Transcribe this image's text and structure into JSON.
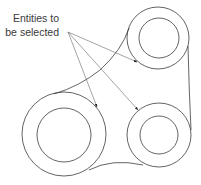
{
  "figure": {
    "annotation": {
      "line1": "Entities to",
      "line2": "be selected"
    },
    "colors": {
      "stroke": "#3c3c3c",
      "arrow": "#555555",
      "text": "#3a3a3a",
      "background": "#ffffff"
    },
    "circles": [
      {
        "name": "top-right",
        "cx": 158,
        "cy": 38,
        "r_outer": 31,
        "r_inner": 20
      },
      {
        "name": "left",
        "cx": 64,
        "cy": 134,
        "r_outer": 42,
        "r_inner": 27
      },
      {
        "name": "bottom-right",
        "cx": 159,
        "cy": 135,
        "r_outer": 32,
        "r_inner": 19
      }
    ],
    "arrows": {
      "origin": [
        68,
        32
      ],
      "targets": [
        [
          137,
          62
        ],
        [
          97,
          107
        ],
        [
          138,
          110
        ]
      ]
    }
  }
}
